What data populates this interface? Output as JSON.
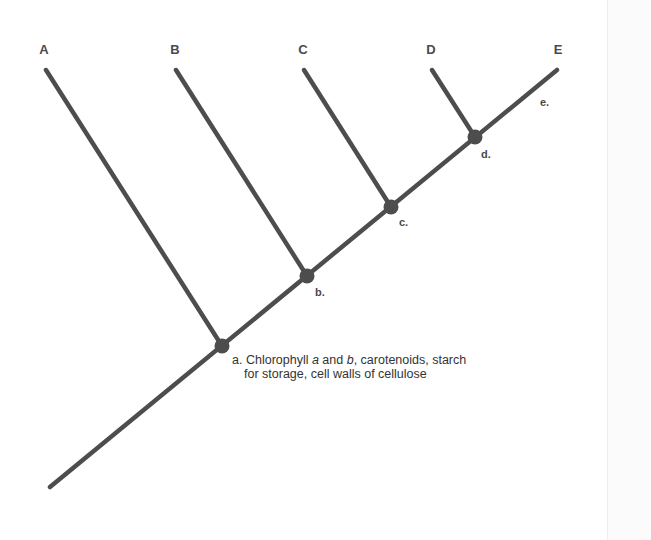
{
  "diagram": {
    "type": "cladogram",
    "colors": {
      "line": "#4d4d4d",
      "node": "#4d4d4d",
      "text": "#333333",
      "background": "#ffffff"
    },
    "root": {
      "x": 50,
      "y": 487
    },
    "trunk_end": {
      "x": 557,
      "y": 70
    },
    "taxa": [
      {
        "id": "A",
        "label": "A",
        "label_x": 44,
        "label_y": 42,
        "tip_x": 46,
        "tip_y": 70,
        "node": "a"
      },
      {
        "id": "B",
        "label": "B",
        "label_x": 175,
        "label_y": 42,
        "tip_x": 176,
        "tip_y": 70,
        "node": "b"
      },
      {
        "id": "C",
        "label": "C",
        "label_x": 303,
        "label_y": 42,
        "tip_x": 304,
        "tip_y": 70,
        "node": "c"
      },
      {
        "id": "D",
        "label": "D",
        "label_x": 431,
        "label_y": 42,
        "tip_x": 432,
        "tip_y": 70,
        "node": "d"
      },
      {
        "id": "E",
        "label": "E",
        "label_x": 558,
        "label_y": 42,
        "tip_x": 557,
        "tip_y": 70,
        "node": null
      }
    ],
    "nodes": [
      {
        "id": "a",
        "label": "a.",
        "x": 222,
        "y": 346,
        "label_x": 232,
        "label_y": 353
      },
      {
        "id": "b",
        "label": "b.",
        "x": 307,
        "y": 276,
        "label_x": 315,
        "label_y": 286
      },
      {
        "id": "c",
        "label": "c.",
        "x": 391,
        "y": 207,
        "label_x": 399,
        "label_y": 216
      },
      {
        "id": "d",
        "label": "d.",
        "x": 475,
        "y": 137,
        "label_x": 481,
        "label_y": 148
      }
    ],
    "branch_labels": [
      {
        "id": "e",
        "label": "e.",
        "x": 540,
        "y": 96
      }
    ],
    "annotation": {
      "marker": "a.",
      "text_parts": [
        "Chlorophyll ",
        "a",
        " and ",
        "b",
        ", carotenoids, starch for storage, cell walls of cellulose"
      ]
    }
  }
}
